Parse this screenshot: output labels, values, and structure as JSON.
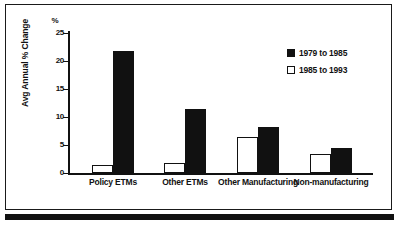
{
  "chart_data": {
    "type": "bar",
    "title": "",
    "xlabel": "",
    "ylabel": "Avg Annual % Change",
    "yunit": "%",
    "ylim": [
      0,
      25
    ],
    "yticks": [
      25,
      20,
      15,
      10,
      5,
      0
    ],
    "grid": false,
    "legend_position": "top-right",
    "categories": [
      "Policy ETMs",
      "Other ETMs",
      "Other Manufacturing",
      "Non-manufacturing"
    ],
    "series": [
      {
        "name": "1985 to 1993",
        "style": "open",
        "values": [
          1.5,
          1.7,
          6.4,
          3.4
        ]
      },
      {
        "name": "1979 to 1985",
        "style": "filled",
        "values": [
          21.7,
          11.5,
          8.2,
          4.5
        ]
      }
    ],
    "colors": {
      "filled": "#111111",
      "open": "#ffffff",
      "outline": "#111111",
      "background": "#ffffff"
    }
  },
  "legend": {
    "items": [
      {
        "label": "1979 to 1985",
        "style": "filled"
      },
      {
        "label": "1985 to 1993",
        "style": "open"
      }
    ]
  }
}
